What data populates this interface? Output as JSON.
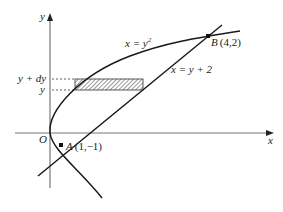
{
  "figure": {
    "axes": {
      "x_label": "x",
      "y_label": "y",
      "origin_label": "O"
    },
    "curves": [
      {
        "name": "parabola",
        "equation_lhs": "x = y",
        "equation_exp": "2"
      },
      {
        "name": "line",
        "equation": "x = y + 2"
      }
    ],
    "points": [
      {
        "name": "A",
        "coords": "(1,−1)"
      },
      {
        "name": "B",
        "coords": "(4,2)"
      }
    ],
    "strip": {
      "upper_label": "y + dy",
      "lower_label": "y"
    },
    "colors": {
      "stroke": "#1a1a1a",
      "axis": "#666666",
      "hatch_fill": "#999999"
    }
  }
}
